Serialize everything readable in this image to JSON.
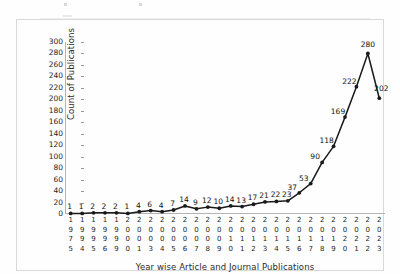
{
  "chart_data": {
    "type": "line",
    "title": "",
    "xlabel": "Year wise Article and Journal Publications",
    "ylabel": "Count of Publications",
    "ylim": [
      0,
      300
    ],
    "ytick_step": 20,
    "yticks": [
      300,
      280,
      260,
      240,
      220,
      200,
      180,
      160,
      140,
      120,
      100,
      80,
      60,
      40,
      20,
      0
    ],
    "grid": false,
    "legend": "none",
    "marker": "filled-circle",
    "line_color": "#1a1a1a",
    "categories": [
      "1975",
      "1994",
      "1995",
      "1996",
      "1999",
      "2000",
      "2001",
      "2003",
      "2004",
      "2005",
      "2006",
      "2007",
      "2008",
      "2009",
      "2010",
      "2011",
      "2012",
      "2013",
      "2014",
      "2015",
      "2016",
      "2017",
      "2018",
      "2019",
      "2020",
      "2021",
      "2022",
      "2023"
    ],
    "values": [
      1,
      1,
      2,
      2,
      2,
      1,
      4,
      6,
      4,
      7,
      14,
      9,
      12,
      10,
      14,
      13,
      17,
      21,
      22,
      23,
      37,
      53,
      90,
      118,
      169,
      222,
      280,
      202
    ],
    "point_labels": [
      "1",
      "1",
      "2",
      "2",
      "2",
      "1",
      "4",
      "6",
      "4",
      "7",
      "14",
      "9",
      "12",
      "10",
      "14",
      "13",
      "17",
      "21",
      "22",
      "23",
      "37",
      "53",
      "90",
      "118",
      "169",
      "222",
      "280",
      "202"
    ]
  },
  "axis": {
    "x_title": "Year wise Article and Journal Publications",
    "y_title": "Count of Publications"
  }
}
